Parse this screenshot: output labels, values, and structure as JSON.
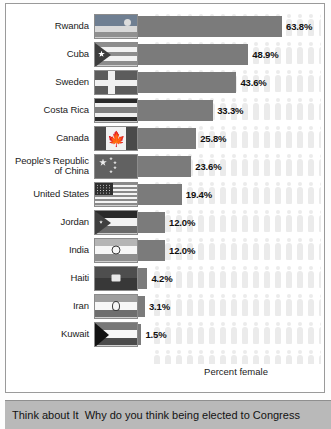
{
  "chart_data": {
    "type": "bar",
    "title": "",
    "xlabel": "Percent female",
    "ylabel": "",
    "orientation": "horizontal",
    "xlim": [
      0,
      70
    ],
    "grid": false,
    "legend": "none",
    "categories": [
      "Rwanda",
      "Cuba",
      "Sweden",
      "Costa Rica",
      "Canada",
      "People's Republic of China",
      "United States",
      "Jordan",
      "India",
      "Haiti",
      "Iran",
      "Kuwait"
    ],
    "values": [
      63.8,
      48.9,
      43.6,
      33.3,
      25.8,
      23.6,
      19.4,
      12.0,
      12.0,
      4.2,
      3.1,
      1.5
    ],
    "value_labels": [
      "63.8%",
      "48.9%",
      "43.6%",
      "33.3%",
      "25.8%",
      "23.6%",
      "19.4%",
      "12.0%",
      "12.0%",
      "4.2%",
      "3.1%",
      "1.5%"
    ],
    "bar_color": "#7b7b7b",
    "background_motif": "person-silhouette",
    "background_motif_color": "#ebebeb"
  },
  "chart": {
    "axis_caption": "Percent female",
    "rows": [
      {
        "country": "Rwanda",
        "country_line2": "",
        "value_label": "63.8%",
        "value": 63.8,
        "flag": "rwanda-flag"
      },
      {
        "country": "Cuba",
        "country_line2": "",
        "value_label": "48.9%",
        "value": 48.9,
        "flag": "cuba-flag"
      },
      {
        "country": "Sweden",
        "country_line2": "",
        "value_label": "43.6%",
        "value": 43.6,
        "flag": "sweden-flag"
      },
      {
        "country": "Costa Rica",
        "country_line2": "",
        "value_label": "33.3%",
        "value": 33.3,
        "flag": "costa-rica-flag"
      },
      {
        "country": "Canada",
        "country_line2": "",
        "value_label": "25.8%",
        "value": 25.8,
        "flag": "canada-flag"
      },
      {
        "country": "People's Republic",
        "country_line2": "of China",
        "value_label": "23.6%",
        "value": 23.6,
        "flag": "china-flag"
      },
      {
        "country": "United States",
        "country_line2": "",
        "value_label": "19.4%",
        "value": 19.4,
        "flag": "united-states-flag"
      },
      {
        "country": "Jordan",
        "country_line2": "",
        "value_label": "12.0%",
        "value": 12.0,
        "flag": "jordan-flag"
      },
      {
        "country": "India",
        "country_line2": "",
        "value_label": "12.0%",
        "value": 12.0,
        "flag": "india-flag"
      },
      {
        "country": "Haiti",
        "country_line2": "",
        "value_label": "4.2%",
        "value": 4.2,
        "flag": "haiti-flag"
      },
      {
        "country": "Iran",
        "country_line2": "",
        "value_label": "3.1%",
        "value": 3.1,
        "flag": "iran-flag"
      },
      {
        "country": "Kuwait",
        "country_line2": "",
        "value_label": "1.5%",
        "value": 1.5,
        "flag": "kuwait-flag"
      }
    ]
  },
  "banner": {
    "lead": "Think about It",
    "question": "Why do you think being elected to Congress"
  }
}
